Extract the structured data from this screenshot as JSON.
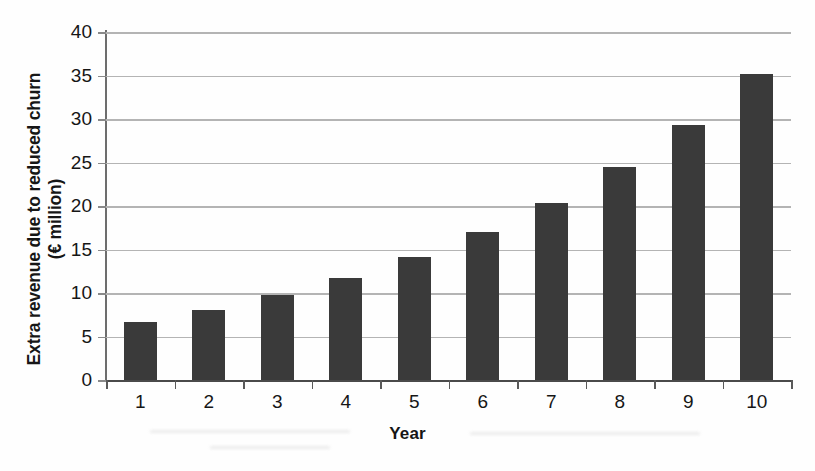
{
  "chart_data": {
    "type": "bar",
    "title": "",
    "xlabel": "Year",
    "ylabel": "Extra revenue due to reduced churn (€ million)",
    "ylabel_line1": "Extra revenue due to reduced churn",
    "ylabel_line2": "(€ million)",
    "categories": [
      "1",
      "2",
      "3",
      "4",
      "5",
      "6",
      "7",
      "8",
      "9",
      "10"
    ],
    "values": [
      6.7,
      8.1,
      9.8,
      11.7,
      14.1,
      17.0,
      20.3,
      24.5,
      29.3,
      35.2
    ],
    "series": [
      {
        "name": "Extra revenue due to reduced churn",
        "values": [
          6.7,
          8.1,
          9.8,
          11.7,
          14.1,
          17.0,
          20.3,
          24.5,
          29.3,
          35.2
        ]
      }
    ],
    "ylim": [
      0,
      40
    ],
    "yticks": [
      0,
      5,
      10,
      15,
      20,
      25,
      30,
      35,
      40
    ],
    "ytick_labels": [
      "0",
      "5",
      "10",
      "15",
      "20",
      "25",
      "30",
      "35",
      "40"
    ],
    "xtick_labels": [
      "1",
      "2",
      "3",
      "4",
      "5",
      "6",
      "7",
      "8",
      "9",
      "10"
    ],
    "grid": true,
    "grid_axis": "y",
    "legend": false,
    "legend_position": "none",
    "bar_color": "#3a3a3a",
    "grid_color": "#b4b4b4",
    "axis_color": "#4a4a4a",
    "background_color": "#fefefe",
    "units": "€ million"
  }
}
